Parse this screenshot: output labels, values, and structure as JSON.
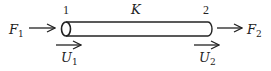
{
  "diagram": {
    "element": {
      "label": "K"
    },
    "nodes": [
      {
        "id": "1",
        "force": {
          "symbol": "F",
          "sub": "1"
        },
        "displacement": {
          "symbol": "U",
          "sub": "1"
        }
      },
      {
        "id": "2",
        "force": {
          "symbol": "F",
          "sub": "2"
        },
        "displacement": {
          "symbol": "U",
          "sub": "2"
        }
      }
    ],
    "colors": {
      "stroke": "#222222",
      "background": "#ffffff"
    }
  }
}
